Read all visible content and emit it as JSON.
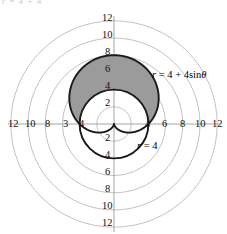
{
  "figure": {
    "width": 227,
    "height": 234,
    "background": "#ffffff",
    "top_edge_artifact": "r = 4 + 4"
  },
  "colors": {
    "grid": "#b3b3b3",
    "axis": "#9a9a9a",
    "curve": "#1a1a1a",
    "shade_fill": "#9b9b9b",
    "text": "#111111"
  },
  "chart_data": {
    "type": "line",
    "subtype": "polar",
    "title": "",
    "xlabel": "",
    "ylabel": "",
    "grid": true,
    "legend": "inline-annotations",
    "center_px": {
      "x": 114,
      "y": 124
    },
    "units_per_px": 0.1163,
    "px_per_unit": 8.6,
    "radial_gridlines": [
      2,
      4,
      6,
      8,
      10,
      12
    ],
    "rmax": 12,
    "axis_x_labels_left": [
      "12",
      "10",
      "8",
      "3",
      "4"
    ],
    "axis_x_labels_right": [
      "4",
      "6",
      "8",
      "10",
      "12"
    ],
    "axis_y_labels_top": [
      "12",
      "10",
      "8",
      "6",
      "4",
      "2"
    ],
    "axis_y_labels_bottom": [
      "2",
      "4",
      "6",
      "8",
      "10",
      "12"
    ],
    "series": [
      {
        "name": "cardioid",
        "equation": "r = 4 + 4sin(theta)",
        "label": "r = 4 + 4sinθ",
        "a": 4,
        "b": 4,
        "style": "solid-dark",
        "max_r": 8,
        "cusp_at": [
          0,
          0
        ],
        "top_point": [
          0,
          8
        ]
      },
      {
        "name": "circle",
        "equation": "r = 4",
        "label": "r = 4",
        "radius": 4,
        "style": "solid-dark",
        "top_point": [
          0,
          4
        ],
        "bottom_point": [
          0,
          -4
        ]
      }
    ],
    "shaded_region": {
      "description": "inside cardioid r = 4 + 4sin(theta), outside circle r = 4",
      "fill": "#9b9b9b",
      "theta_range_deg": [
        0,
        180
      ]
    }
  },
  "annotations": {
    "cardioid_label": "r = 4 + 4sinθ",
    "cardioid_label_r": "r",
    "cardioid_label_rest": " = 4 + 4sin",
    "cardioid_label_theta": "θ",
    "circle_label_r": "r",
    "circle_label_rest": " = 4"
  }
}
